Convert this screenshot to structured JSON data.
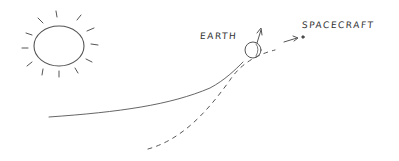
{
  "diagram": {
    "labels": {
      "earth": "EARTH",
      "spacecraft": "SPACECRAFT"
    },
    "elements": [
      "sun",
      "earth",
      "earth-orbit",
      "spacecraft",
      "spacecraft-trajectory",
      "earth-velocity-arrow",
      "spacecraft-velocity-arrow"
    ],
    "colors": {
      "ink": "#555555",
      "background": "#ffffff"
    }
  }
}
